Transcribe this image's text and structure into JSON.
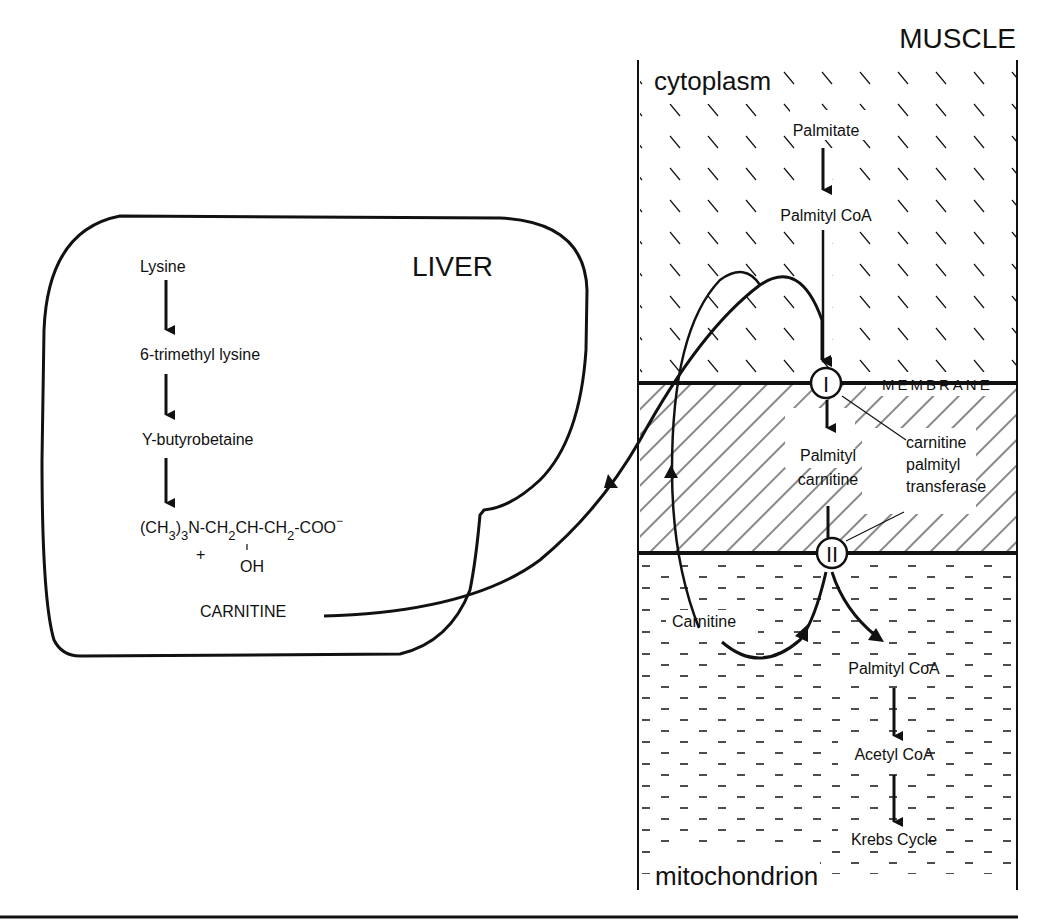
{
  "liver": {
    "title": "LIVER",
    "pathway": [
      "Lysine",
      "6-trimethyl lysine",
      "Υ-butyrobetaine"
    ],
    "formula": {
      "main": "(CH3)3N-CH2CH-CH2-COO",
      "parts": [
        "(CH",
        "3",
        ")",
        "3",
        "N-CH",
        "2",
        "CH-CH",
        "2",
        "-COO",
        "−"
      ],
      "charge": "+",
      "substituent": "OH"
    },
    "product": "CARNITINE"
  },
  "muscle": {
    "title": "MUSCLE",
    "cytoplasm": {
      "label": "cytoplasm",
      "pathway": [
        "Palmitate",
        "Palmityl CoA"
      ]
    },
    "membrane": {
      "label": "MEMBRANE",
      "enzyme_sites": [
        "I",
        "II"
      ],
      "intermediate": [
        "Palmityl",
        "carnitine"
      ],
      "enzyme_label": [
        "carnitine",
        "palmityl",
        "transferase"
      ]
    },
    "mitochondrion": {
      "label": "mitochondrion",
      "recycled": "Carnitine",
      "pathway": [
        "Palmityl CoA",
        "Acetyl CoA",
        "Krebs Cycle"
      ]
    }
  },
  "colors": {
    "ink": "#111111",
    "background": "#ffffff"
  }
}
